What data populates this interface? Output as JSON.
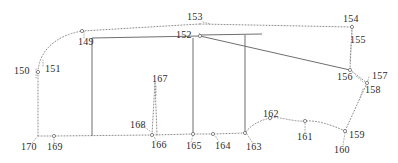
{
  "figure": {
    "background_color": "#ffffff",
    "line_color": "#8d8d8d",
    "solid_line_color": "#6f6f6f",
    "label_color": "#2b2b2b",
    "width": 398,
    "height": 163
  },
  "labels": [
    {
      "id": "149",
      "text": "149",
      "x": 78,
      "y": 45
    },
    {
      "id": "150",
      "text": "150",
      "x": 14,
      "y": 74
    },
    {
      "id": "151",
      "text": "151",
      "x": 45,
      "y": 72
    },
    {
      "id": "152",
      "text": "152",
      "x": 176,
      "y": 38
    },
    {
      "id": "153",
      "text": "153",
      "x": 187,
      "y": 20
    },
    {
      "id": "154",
      "text": "154",
      "x": 343,
      "y": 22
    },
    {
      "id": "155",
      "text": "155",
      "x": 350,
      "y": 43
    },
    {
      "id": "156",
      "text": "156",
      "x": 337,
      "y": 80
    },
    {
      "id": "157",
      "text": "157",
      "x": 372,
      "y": 79
    },
    {
      "id": "158",
      "text": "158",
      "x": 365,
      "y": 93
    },
    {
      "id": "159",
      "text": "159",
      "x": 349,
      "y": 138
    },
    {
      "id": "160",
      "text": "160",
      "x": 334,
      "y": 153
    },
    {
      "id": "161",
      "text": "161",
      "x": 297,
      "y": 140
    },
    {
      "id": "162",
      "text": "162",
      "x": 263,
      "y": 117
    },
    {
      "id": "163",
      "text": "163",
      "x": 246,
      "y": 150
    },
    {
      "id": "164",
      "text": "164",
      "x": 215,
      "y": 149
    },
    {
      "id": "165",
      "text": "165",
      "x": 186,
      "y": 149
    },
    {
      "id": "166",
      "text": "166",
      "x": 151,
      "y": 148
    },
    {
      "id": "167",
      "text": "167",
      "x": 152,
      "y": 82
    },
    {
      "id": "168",
      "text": "168",
      "x": 130,
      "y": 128
    },
    {
      "id": "169",
      "text": "169",
      "x": 47,
      "y": 150
    },
    {
      "id": "170",
      "text": "170",
      "x": 21,
      "y": 150
    }
  ],
  "nodes": [
    {
      "id": "node-151",
      "x": 38,
      "y": 72
    },
    {
      "id": "node-149",
      "x": 82,
      "y": 31
    },
    {
      "id": "node-152",
      "x": 200,
      "y": 36
    },
    {
      "id": "node-154",
      "x": 352,
      "y": 27
    },
    {
      "id": "node-156",
      "x": 350,
      "y": 70
    },
    {
      "id": "node-157",
      "x": 367,
      "y": 83
    },
    {
      "id": "node-159",
      "x": 345,
      "y": 131
    },
    {
      "id": "node-161",
      "x": 305,
      "y": 121
    },
    {
      "id": "node-162",
      "x": 270,
      "y": 118
    },
    {
      "id": "node-163",
      "x": 245,
      "y": 133
    },
    {
      "id": "node-164",
      "x": 213,
      "y": 134
    },
    {
      "id": "node-165",
      "x": 193,
      "y": 134
    },
    {
      "id": "node-166",
      "x": 152,
      "y": 135
    },
    {
      "id": "node-169",
      "x": 54,
      "y": 136
    }
  ],
  "paths": {
    "outer_top_left_curve": "M 38 72 C 39 52, 54 36, 82 31",
    "outer_top_edge": "M 82 31 L 200 24",
    "top_right_edge": "M 200 24 L 352 27",
    "right_upper_edge": "M 352 27 L 350 70",
    "right_corner_edge": "M 350 70 L 367 83",
    "right_lower_edge": "M 367 83 L 345 131",
    "bottom_right_curve": "M 345 131 C 330 124, 315 120, 305 121",
    "bottom_mid_curve": "M 305 121 C 292 122, 280 116, 270 118",
    "bottom_left_of_162": "M 270 118 C 258 121, 250 126, 245 133",
    "bottom_edge_164": "M 245 133 L 213 134",
    "bottom_edge_165": "M 213 134 L 193 134",
    "bottom_edge_166": "M 193 134 L 152 135",
    "bottom_edge_169": "M 152 135 L 54 136",
    "bottom_edge_170": "M 54 136 L 38 136",
    "left_edge": "M 38 136 L 38 72",
    "spike_167": "M 152 135 L 155 82 L 157 135",
    "solid_vertical_left": "M 92 38 L 92 136",
    "solid_vertical_mid": "M 193 38 L 193 133",
    "solid_vertical_right": "M 245 35 L 245 133",
    "solid_top_box_edge": "M 92 38 L 200 36",
    "solid_diagonal_152_156": "M 200 36 L 350 70",
    "solid_short_horizontal": "M 200 35 L 262 34"
  },
  "leaders": [
    {
      "id": "leader-150",
      "d": "M 36 69 L 36 78"
    },
    {
      "id": "leader-151",
      "d": "M 43 66 L 43 60"
    },
    {
      "id": "leader-149",
      "d": "M 84 38 L 84 31"
    },
    {
      "id": "leader-153",
      "d": "M 203 22 L 210 24"
    },
    {
      "id": "leader-152",
      "d": "M 199 33 L 202 36"
    },
    {
      "id": "leader-154",
      "d": "M 352 25 L 352 36"
    },
    {
      "id": "leader-155",
      "d": "M 351 45 L 350 62"
    },
    {
      "id": "leader-156",
      "d": "M 356 76 L 363 82"
    },
    {
      "id": "leader-157",
      "d": "M 369 77 L 367 83"
    },
    {
      "id": "leader-158",
      "d": "M 363 89 L 360 98"
    },
    {
      "id": "leader-159",
      "d": "M 347 133 L 345 131"
    },
    {
      "id": "leader-160",
      "d": "M 343 145 L 345 133"
    },
    {
      "id": "leader-161",
      "d": "M 305 133 L 305 123"
    },
    {
      "id": "leader-162",
      "d": "M 270 120 L 270 116"
    },
    {
      "id": "leader-163",
      "d": "M 252 142 L 247 134"
    },
    {
      "id": "leader-164",
      "d": "M 219 142 L 215 135"
    },
    {
      "id": "leader-165",
      "d": "M 191 142 L 193 136"
    },
    {
      "id": "leader-166",
      "d": "M 156 141 L 154 136"
    },
    {
      "id": "leader-167",
      "d": "M 156 86 L 156 96"
    },
    {
      "id": "leader-168",
      "d": "M 140 124 L 150 131"
    },
    {
      "id": "leader-169",
      "d": "M 54 143 L 54 137"
    },
    {
      "id": "leader-170",
      "d": "M 32 143 L 37 137"
    }
  ]
}
